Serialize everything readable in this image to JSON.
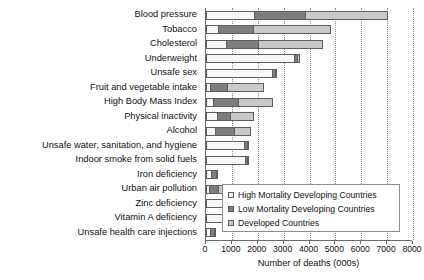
{
  "chart_data": {
    "type": "bar",
    "orientation": "horizontal",
    "stacked": true,
    "title": "",
    "xlabel": "Number of deaths (000s)",
    "ylabel": "",
    "xlim": [
      0,
      8000
    ],
    "xticks": [
      0,
      1000,
      2000,
      3000,
      4000,
      5000,
      6000,
      7000,
      8000
    ],
    "grid": "vertical-dotted",
    "legend_position": "inside-lower-right",
    "categories": [
      "Blood pressure",
      "Tobacco",
      "Cholesterol",
      "Underweight",
      "Unsafe sex",
      "Fruit and vegetable intake",
      "High Body Mass Index",
      "Physical inactivity",
      "Alcohol",
      "Unsafe water, sanitation, and hygiene",
      "Indoor smoke from solid fuels",
      "Iron deficiency",
      "Urban air pollution",
      "Zinc deficiency",
      "Vitamin A deficiency",
      "Unsafe health care injections"
    ],
    "series": [
      {
        "name": "High Mortality Developing Countries",
        "color": "#f7f7f7",
        "values": [
          1900,
          500,
          800,
          3450,
          2600,
          200,
          300,
          450,
          400,
          1500,
          1550,
          250,
          150,
          800,
          750,
          200
        ]
      },
      {
        "name": "Low Mortality Developing Countries",
        "color": "#7d7d7d",
        "values": [
          2000,
          1400,
          1300,
          150,
          150,
          700,
          1000,
          550,
          750,
          150,
          100,
          200,
          400,
          100,
          50,
          200
        ]
      },
      {
        "name": "Developed Countries",
        "color": "#c9c9c9",
        "values": [
          3200,
          3000,
          2500,
          100,
          50,
          1400,
          1350,
          950,
          650,
          50,
          50,
          100,
          500,
          50,
          50,
          50
        ]
      }
    ],
    "totals": [
      7100,
      4900,
      4600,
      3700,
      2800,
      2300,
      2650,
      1950,
      1800,
      1700,
      1700,
      550,
      1050,
      950,
      850,
      450
    ]
  },
  "legend": {
    "items": [
      {
        "label": "High Mortality Developing Countries",
        "swatch": "light-gray-swatch"
      },
      {
        "label": "Low Mortality Developing Countries",
        "swatch": "dark-gray-swatch"
      },
      {
        "label": "Developed Countries",
        "swatch": "medium-gray-swatch"
      }
    ]
  }
}
